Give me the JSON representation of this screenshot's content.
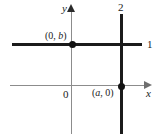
{
  "figure": {
    "axes": {
      "x_label": "x",
      "y_label": "y",
      "origin_label": "0"
    },
    "lines": [
      {
        "id": "line-1",
        "label": "1",
        "orientation": "horizontal"
      },
      {
        "id": "line-2",
        "label": "2",
        "orientation": "vertical"
      }
    ],
    "points": [
      {
        "id": "y-intercept",
        "label_open": "(0, ",
        "label_var": "b",
        "label_close": ")"
      },
      {
        "id": "x-intercept",
        "label_open": "(",
        "label_var": "a",
        "label_close": ", 0)"
      }
    ],
    "colors": {
      "line": "#1b1b1b",
      "axis": "#8c8c8c",
      "dot": "#121212",
      "background": "#ffffff"
    }
  },
  "chart_data": {
    "type": "line",
    "title": "",
    "xlabel": "x",
    "ylabel": "y",
    "grid": false,
    "legend": "inline-end-labels",
    "xlim": [
      -2.5,
      3.2
    ],
    "ylim": [
      -2.0,
      2.5
    ],
    "series": [
      {
        "name": "1",
        "description": "horizontal line y = b",
        "x": [
          -2.4,
          2.8
        ],
        "y": [
          1.0,
          1.0
        ]
      },
      {
        "name": "2",
        "description": "vertical line x = a",
        "x": [
          2.0,
          2.0
        ],
        "y": [
          2.4,
          -2.0
        ]
      }
    ],
    "annotations": [
      {
        "text": "(0, b)",
        "x": 0.0,
        "y": 1.0,
        "marker": "filled-circle"
      },
      {
        "text": "(a, 0)",
        "x": 2.0,
        "y": 0.0,
        "marker": "filled-circle"
      },
      {
        "text": "0",
        "x": 0.0,
        "y": 0.0,
        "marker": "none"
      },
      {
        "text": "1",
        "x": 3.0,
        "y": 1.0,
        "marker": "none"
      },
      {
        "text": "2",
        "x": 2.0,
        "y": 2.5,
        "marker": "none"
      }
    ]
  }
}
